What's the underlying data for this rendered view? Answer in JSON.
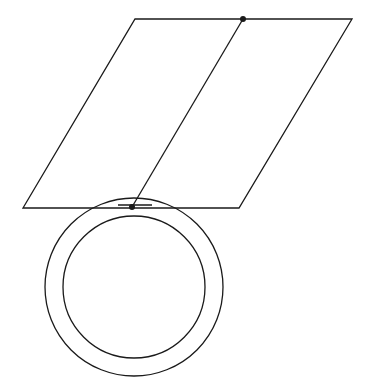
{
  "diagram": {
    "stroke_color": "#1a1a1a",
    "background": "#ffffff",
    "plane": {
      "shape": "parallelogram",
      "points": "135,19 352,19 239,208 23,208"
    },
    "outer_circle": {
      "cx": 134,
      "cy": 287,
      "r": 89
    },
    "inner_circle": {
      "cx": 134,
      "cy": 287,
      "r": 71
    },
    "connecting_line": {
      "x1": 243,
      "y1": 19,
      "x2": 132,
      "y2": 207
    },
    "points": [
      {
        "name": "top-point",
        "cx": 243,
        "cy": 19,
        "r": 3
      },
      {
        "name": "bottom-point",
        "cx": 132,
        "cy": 207,
        "r": 3
      }
    ],
    "chord": {
      "x1": 118,
      "y1": 205,
      "x2": 152,
      "y2": 205
    }
  }
}
